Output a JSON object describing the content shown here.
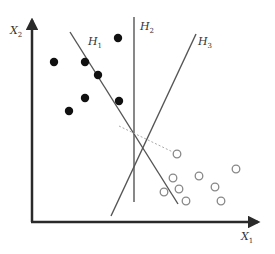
{
  "axes": {
    "x_label": "X",
    "x_sub": "1",
    "y_label": "X",
    "y_sub": "2",
    "color": "#2a2a2a"
  },
  "hyperplanes": [
    {
      "name": "H",
      "sub": "1",
      "x1": 70,
      "y1": 32,
      "x2": 178,
      "y2": 204,
      "lx": 88,
      "ly": 45
    },
    {
      "name": "H",
      "sub": "2",
      "x1": 134,
      "y1": 17,
      "x2": 134,
      "y2": 202,
      "lx": 140,
      "ly": 30
    },
    {
      "name": "H",
      "sub": "3",
      "x1": 196,
      "y1": 34,
      "x2": 111,
      "y2": 216,
      "lx": 198,
      "ly": 45
    }
  ],
  "class_filled": {
    "color": "#111111",
    "points": [
      [
        118,
        38
      ],
      [
        54,
        62
      ],
      [
        85,
        62
      ],
      [
        98,
        75
      ],
      [
        85,
        98
      ],
      [
        119,
        101
      ],
      [
        69,
        111
      ]
    ]
  },
  "class_open": {
    "color": "#888888",
    "points": [
      [
        177,
        154
      ],
      [
        173,
        178
      ],
      [
        199,
        176
      ],
      [
        236,
        169
      ],
      [
        164,
        192
      ],
      [
        179,
        189
      ],
      [
        215,
        187
      ],
      [
        186,
        201
      ],
      [
        221,
        201
      ]
    ]
  },
  "margin_line": {
    "x1": 119,
    "y1": 126,
    "x2": 177,
    "y2": 154,
    "color": "#aaaaaa"
  }
}
